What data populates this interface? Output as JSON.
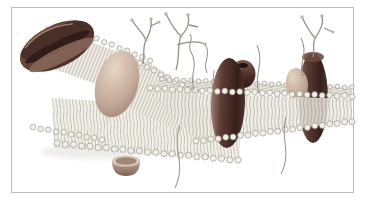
{
  "figure": {
    "type": "scientific-illustration",
    "frame": {
      "background": "#ffffff",
      "border_color": "#bcbcbc"
    },
    "colors": {
      "lipid_head": "#f1eee7",
      "lipid_head_outline": "#8f8b82",
      "lipid_tail": "#a8a49a",
      "protein_dark": "#5d3c33",
      "protein_dark_deep": "#35201b",
      "protein_dark_light": "#9a7c6f",
      "protein_tan": "#c2a896",
      "protein_tan_light": "#e6d6c8",
      "protein_tan_dark": "#8f7364",
      "glycan": "#8f9086",
      "filament": "#9a8a7a",
      "pore_hole": "#231310"
    },
    "components": [
      {
        "id": "membrane-bilayer",
        "label": "phospholipid bilayer sheet with lipid head beads and tails"
      },
      {
        "id": "disc-protein",
        "label": "tilted stacked-disc membrane protein (upper left)"
      },
      {
        "id": "globular-protein",
        "label": "tan globular protein embedded in upper leaflet"
      },
      {
        "id": "channel-protein",
        "label": "dark transmembrane channel protein pair with open pore"
      },
      {
        "id": "transmembrane-protein",
        "label": "dark transmembrane glycoprotein (right)"
      },
      {
        "id": "glycan-trees",
        "label": "branched carbohydrate chains on membrane surface"
      },
      {
        "id": "peripheral-protein",
        "label": "small cup-shaped peripheral protein below membrane"
      },
      {
        "id": "filaments",
        "label": "thin curved filaments"
      }
    ]
  }
}
